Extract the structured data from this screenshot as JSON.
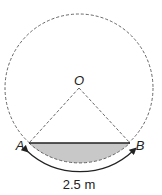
{
  "diagram": {
    "center_label": "O",
    "point_a_label": "A",
    "point_b_label": "B",
    "arc_length_label": "2.5 m",
    "colors": {
      "outline": "#555555",
      "chord": "#222222",
      "segment_fill": "#c8c8c8",
      "arrow": "#222222"
    }
  }
}
